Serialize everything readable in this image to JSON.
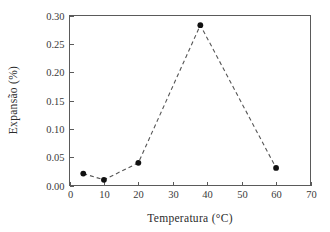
{
  "chart_data": {
    "type": "line",
    "title": "",
    "subtitle": "",
    "xlabel": "Temperatura (°C)",
    "ylabel": "Expansão (%)",
    "xlim": [
      0,
      70
    ],
    "ylim": [
      0.0,
      0.3
    ],
    "xticks": [
      0,
      10,
      20,
      30,
      40,
      50,
      60,
      70
    ],
    "xtick_labels": [
      "0",
      "10",
      "20",
      "30",
      "40",
      "50",
      "60",
      "70"
    ],
    "yticks": [
      0.0,
      0.05,
      0.1,
      0.15,
      0.2,
      0.25,
      0.3
    ],
    "ytick_labels": [
      "0.00",
      "0.05",
      "0.10",
      "0.15",
      "0.20",
      "0.25",
      "0.30"
    ],
    "grid": false,
    "legend": false,
    "legend_position": "none",
    "line_style": "dashed",
    "marker_style": "filled-circle",
    "series": [
      {
        "name": "Expansão",
        "x": [
          4,
          10,
          20,
          38,
          60
        ],
        "values": [
          0.021,
          0.01,
          0.04,
          0.283,
          0.031
        ]
      }
    ],
    "colors": {
      "line": "#555555",
      "marker": "#111111",
      "axis": "#5a5a5a",
      "text": "#2b2b2b",
      "background": "#ffffff"
    }
  },
  "axes": {
    "x_axis_name": "Temperatura",
    "y_axis_name": "Expansão"
  }
}
